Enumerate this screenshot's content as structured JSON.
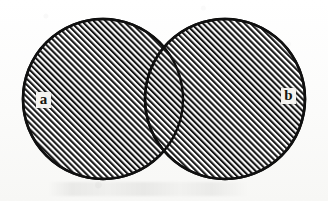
{
  "figure": {
    "type": "venn-diagram",
    "title": "",
    "background_color": "#fdfdfc",
    "ink_color": "#141414",
    "fill_pattern": "diagonal-hatch-45",
    "hatch_color": "#1a1a1a",
    "hatch_spacing_px": 3,
    "width": 328,
    "height": 201
  },
  "sets": [
    {
      "id": "a",
      "label": "a",
      "label_x": 36,
      "label_y": 92,
      "center_x": 103,
      "center_y": 99,
      "radius": 80,
      "shaded": true
    },
    {
      "id": "b",
      "label": "b",
      "label_x": 281,
      "label_y": 88,
      "center_x": 225,
      "center_y": 99,
      "radius": 80,
      "shaded": true
    }
  ],
  "regions": {
    "a_only": {
      "shaded": true
    },
    "b_only": {
      "shaded": true
    },
    "intersection": {
      "shaded": true,
      "label": ""
    },
    "outside": {
      "shaded": false
    }
  }
}
